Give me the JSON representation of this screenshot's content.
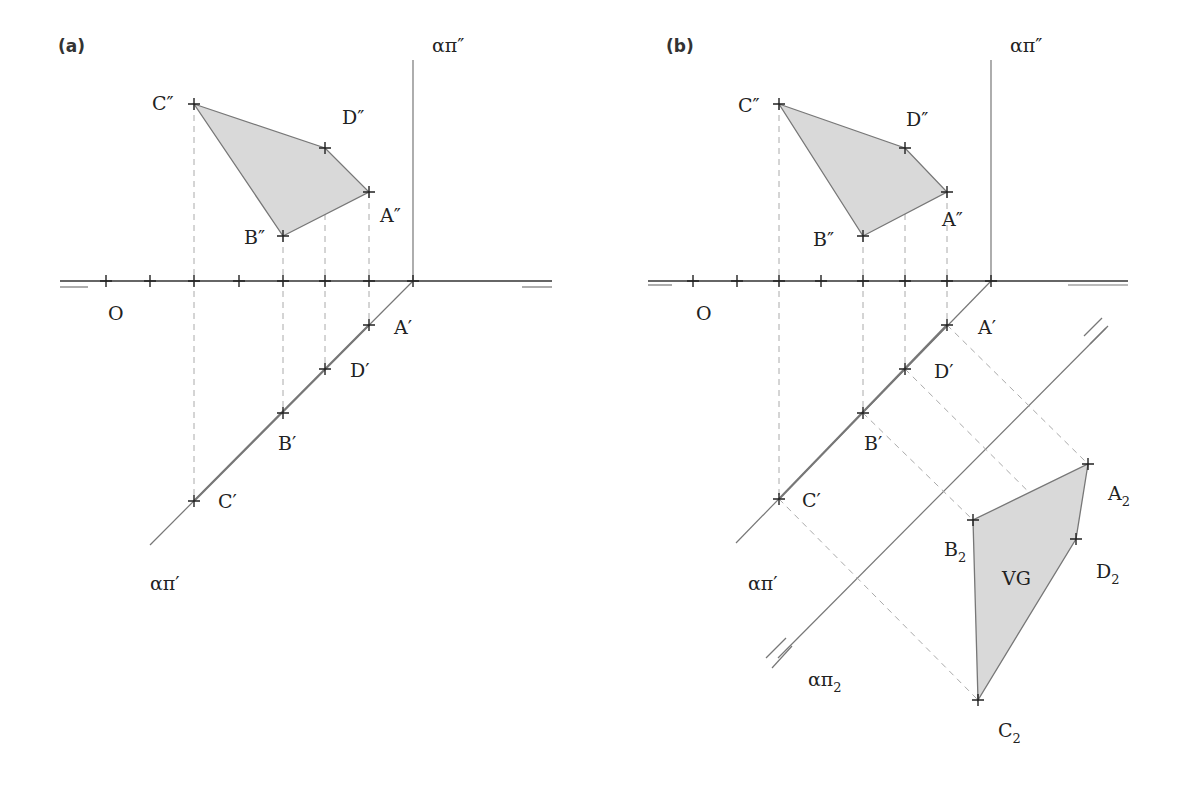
{
  "figure": {
    "panels": [
      {
        "id": "a",
        "label": "(a)",
        "origin_label": "O",
        "frontal_trace_label": "απ″",
        "horizontal_trace_label": "απ′",
        "front_view_points": [
          {
            "name": "C″",
            "x": 194,
            "y": 104
          },
          {
            "name": "D″",
            "x": 325,
            "y": 148
          },
          {
            "name": "A″",
            "x": 369,
            "y": 192
          },
          {
            "name": "B″",
            "x": 283,
            "y": 236
          }
        ],
        "top_view_points": [
          {
            "name": "A′",
            "x": 369,
            "y": 325
          },
          {
            "name": "D′",
            "x": 325,
            "y": 369
          },
          {
            "name": "B′",
            "x": 283,
            "y": 413
          },
          {
            "name": "C′",
            "x": 194,
            "y": 501
          }
        ],
        "ground_line_ticks_x": [
          106,
          150,
          194,
          239,
          283,
          325,
          369,
          413
        ]
      },
      {
        "id": "b",
        "label": "(b)",
        "origin_label": "O",
        "frontal_trace_label": "απ″",
        "horizontal_trace_label": "απ′",
        "auxiliary_trace_label": "απ",
        "auxiliary_trace_sub": "2",
        "true_shape_label": "VG",
        "front_view_points": [
          {
            "name": "C″",
            "x": 779,
            "y": 104
          },
          {
            "name": "D″",
            "x": 905,
            "y": 148
          },
          {
            "name": "A″",
            "x": 947,
            "y": 192
          },
          {
            "name": "B″",
            "x": 863,
            "y": 236
          }
        ],
        "top_view_points": [
          {
            "name": "A′",
            "x": 947,
            "y": 325
          },
          {
            "name": "D′",
            "x": 905,
            "y": 369
          },
          {
            "name": "B′",
            "x": 863,
            "y": 413
          },
          {
            "name": "C′",
            "x": 779,
            "y": 499
          }
        ],
        "auxiliary_view_points": [
          {
            "name": "A",
            "sub": "2",
            "x": 1088,
            "y": 464
          },
          {
            "name": "D",
            "sub": "2",
            "x": 1076,
            "y": 539
          },
          {
            "name": "B",
            "sub": "2",
            "x": 973,
            "y": 520
          },
          {
            "name": "C",
            "sub": "2",
            "x": 978,
            "y": 700
          }
        ],
        "ground_line_ticks_x": [
          693,
          737,
          779,
          821,
          863,
          905,
          947,
          991
        ]
      }
    ],
    "colors": {
      "fill": "#d9d9d9",
      "line": "#777777",
      "text": "#222222"
    }
  }
}
